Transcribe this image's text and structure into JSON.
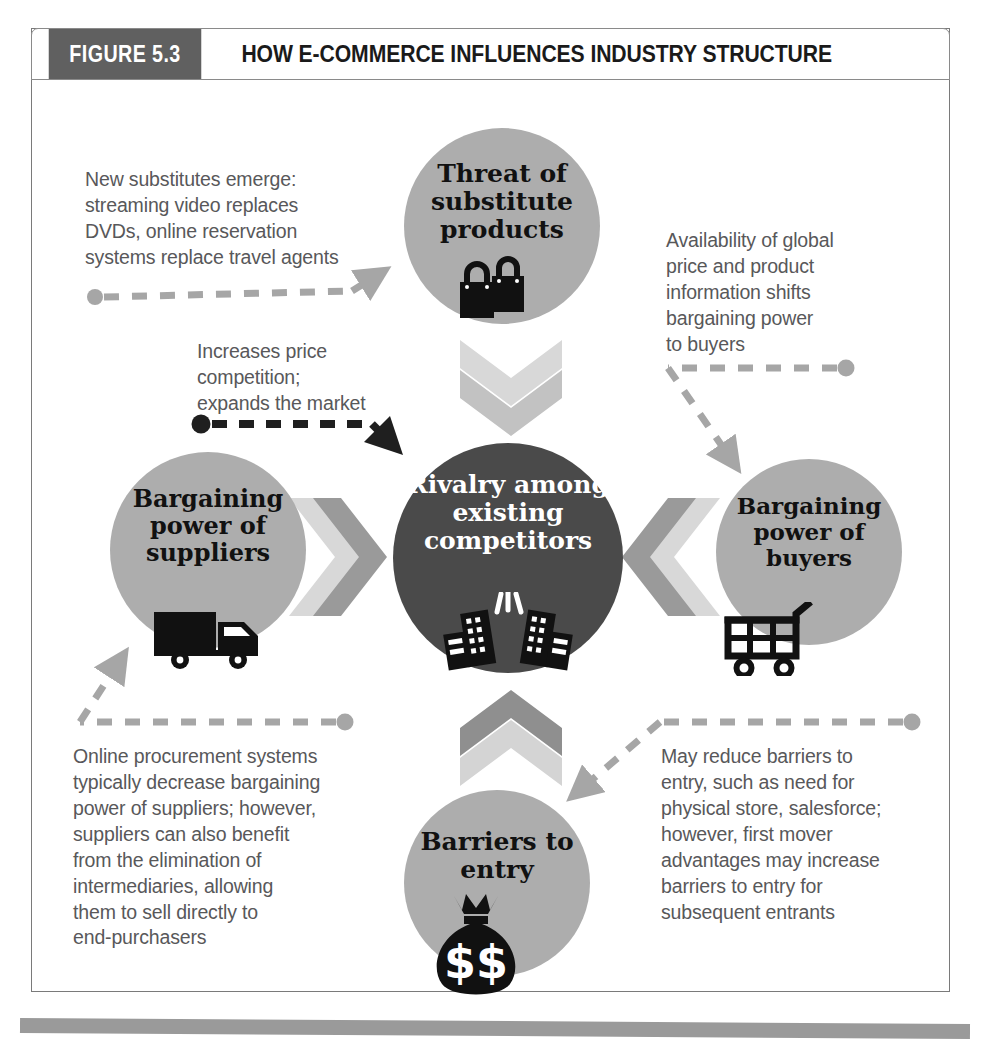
{
  "figure": {
    "number_label": "FIGURE 5.3",
    "title": "HOW E-COMMERCE INFLUENCES INDUSTRY STRUCTURE"
  },
  "colors": {
    "header_block": "#606060",
    "circle_gray": "#adadad",
    "circle_dark": "#4a4a4a",
    "chevron_light": "#d8d8d8",
    "chevron_mid": "#9a9a9a",
    "note_text": "#58585a",
    "dashed_gray": "#a6a6a6",
    "dashed_dark": "#1f1f1f",
    "bottom_rule": "#9a9a9a"
  },
  "forces": [
    {
      "id": "substitutes",
      "label": "Threat of\nsubstitute\nproducts",
      "icon": "shopping-bags-icon",
      "style": "gray"
    },
    {
      "id": "rivalry",
      "label": "Rivalry\namong\nexisting\ncompetitors",
      "icon": "colliding-buildings-icon",
      "style": "dark"
    },
    {
      "id": "suppliers",
      "label": "Bargaining\npower of\nsuppliers",
      "icon": "delivery-truck-icon",
      "style": "gray"
    },
    {
      "id": "buyers",
      "label": "Bargaining\npower of\nbuyers",
      "icon": "shopping-cart-icon",
      "style": "gray"
    },
    {
      "id": "barriers",
      "label": "Barriers\nto entry",
      "icon": "money-bag-icon",
      "style": "gray"
    }
  ],
  "notes": [
    {
      "id": "substitutes-note",
      "text": "New substitutes emerge:\nstreaming video replaces\nDVDs, online reservation\nsystems replace travel agents",
      "connector": "dashed-gray-arrow-right"
    },
    {
      "id": "rivalry-note",
      "text": "Increases price\ncompetition;\nexpands the market",
      "connector": "dashed-dark-arrow-right-down"
    },
    {
      "id": "buyers-note",
      "text": "Availability of global\nprice and product\ninformation shifts\nbargaining power\nto buyers",
      "connector": "dashed-gray-arrow-left-down"
    },
    {
      "id": "suppliers-note",
      "text": "Online procurement systems\ntypically decrease bargaining\npower of suppliers; however,\nsuppliers can also benefit\nfrom the elimination of\nintermediaries, allowing\nthem to sell directly to\nend-purchasers",
      "connector": "dashed-gray-arrow-left-up"
    },
    {
      "id": "barriers-note",
      "text": "May reduce barriers to\nentry, such as need for\nphysical store, salesforce;\nhowever, first mover\nadvantages may increase\nbarriers to entry for\nsubsequent entrants",
      "connector": "dashed-gray-arrow-left-down"
    }
  ],
  "chevrons": [
    {
      "id": "chevron-down-top",
      "direction": "down"
    },
    {
      "id": "chevron-right-left",
      "direction": "right"
    },
    {
      "id": "chevron-left-right",
      "direction": "left"
    },
    {
      "id": "chevron-up-bottom",
      "direction": "up"
    }
  ]
}
